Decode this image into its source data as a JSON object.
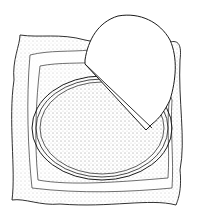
{
  "illustration": {
    "subject": "pie crust partially lifted from a round tart pan resting on a cloth",
    "colors": {
      "line": "#1a1a1a",
      "background": "#ffffff",
      "stipple": "#9a9a9a"
    }
  }
}
